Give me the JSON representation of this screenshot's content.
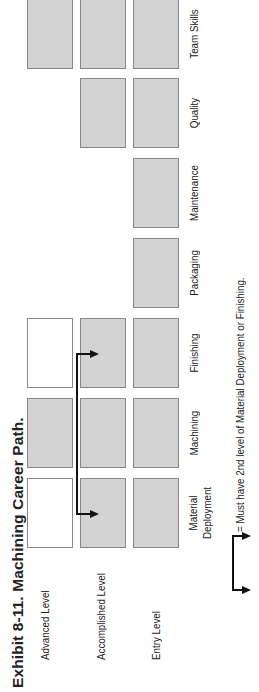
{
  "title": "Exhibit 8-11.  Machining Career Path.",
  "levels": [
    {
      "label": "Advanced Level"
    },
    {
      "label": "Accomplished Level"
    },
    {
      "label": "Entry Level"
    }
  ],
  "columns": [
    {
      "label": "Material Deployment",
      "label_line1": "Material",
      "label_line2": "Deployment",
      "levels": {
        "advanced": "empty",
        "accomplished": "filled",
        "entry": "filled"
      }
    },
    {
      "label": "Machining",
      "levels": {
        "advanced": "filled",
        "accomplished": "filled",
        "entry": "filled"
      }
    },
    {
      "label": "Finishing",
      "levels": {
        "advanced": "empty",
        "accomplished": "filled",
        "entry": "filled"
      }
    },
    {
      "label": "Packaging",
      "levels": {
        "entry": "filled"
      }
    },
    {
      "label": "Maintenance",
      "levels": {
        "entry": "filled"
      }
    },
    {
      "label": "Quality",
      "levels": {
        "accomplished": "filled",
        "entry": "filled"
      }
    },
    {
      "label": "Team Skills",
      "levels": {
        "advanced": "filled",
        "accomplished": "filled",
        "entry": "filled"
      }
    }
  ],
  "legend": {
    "symbol": "bracket-arrow",
    "text": "= Must have 2nd level of Material Deployment or Finishing."
  },
  "colors": {
    "filled_box": "#d3d3d3",
    "box_border": "#888888",
    "arrow": "#111111"
  }
}
